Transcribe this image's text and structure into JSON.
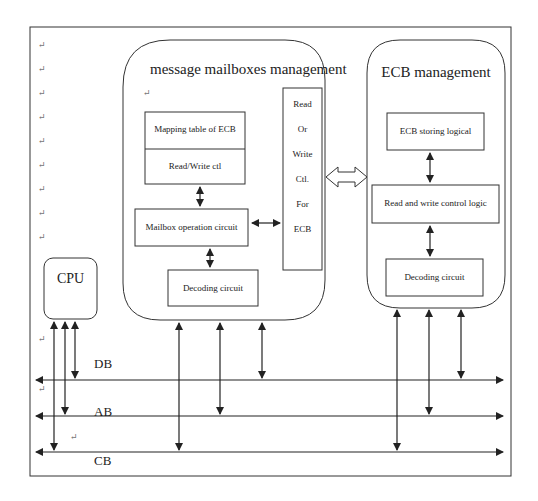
{
  "diagram": {
    "mailbox_group": {
      "title": "message mailboxes management",
      "mapping_table": "Mapping table of ECB",
      "rw_ctl": "Read/Write ctl",
      "mailbox_op": "Mailbox operation circuit",
      "decoding": "Decoding circuit",
      "rw_for_ecb": [
        "Read",
        "Or",
        "Write",
        "Ctl.",
        "For",
        "ECB"
      ]
    },
    "ecb_group": {
      "title": "ECB management",
      "storing": "ECB storing logical",
      "rw_logic": "Read and write control logic",
      "decoding": "Decoding circuit"
    },
    "cpu": "CPU",
    "buses": {
      "db": "DB",
      "ab": "AB",
      "cb": "CB"
    },
    "paragraph_mark": "↵"
  }
}
